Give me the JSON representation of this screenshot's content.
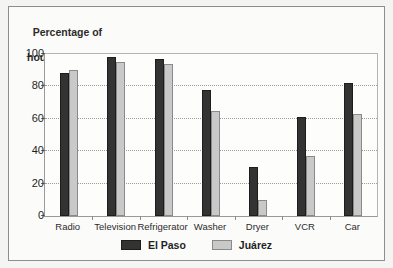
{
  "chart_data": {
    "type": "bar",
    "title": "Percentage of households",
    "title_line1": "Percentage of",
    "title_line2": "households",
    "xlabel": "",
    "ylabel": "Percentage of households",
    "categories": [
      "Radio",
      "Television",
      "Refrigerator",
      "Washer",
      "Dryer",
      "VCR",
      "Car"
    ],
    "series": [
      {
        "name": "El Paso",
        "color": "#333333",
        "values": [
          88,
          98,
          97,
          78,
          30,
          61,
          82
        ]
      },
      {
        "name": "Juárez",
        "color": "#c9c9c9",
        "values": [
          90,
          95,
          94,
          65,
          10,
          37,
          63
        ]
      }
    ],
    "ylim": [
      0,
      100
    ],
    "yticks": [
      0,
      20,
      40,
      60,
      80,
      100
    ],
    "ytick_labels": [
      "0",
      "20",
      "40",
      "60",
      "80",
      "100"
    ],
    "grid": true,
    "gridlines_at": [
      20,
      40,
      60,
      80
    ],
    "legend_position": "bottom"
  },
  "legend": {
    "items": [
      {
        "label": "El Paso"
      },
      {
        "label": "Juárez"
      }
    ]
  }
}
